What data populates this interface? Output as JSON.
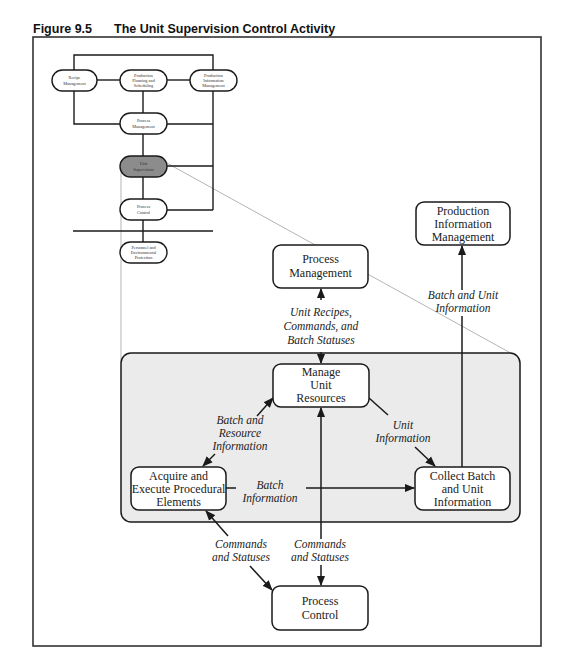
{
  "figure": {
    "number": "Figure 9.5",
    "title": "The Unit Supervision Control Activity"
  },
  "overview": {
    "nodes": [
      {
        "id": "recipe",
        "lines": [
          "Recipe",
          "Management"
        ],
        "highlighted": false
      },
      {
        "id": "planning",
        "lines": [
          "Production",
          "Planning and",
          "Scheduling"
        ],
        "highlighted": false
      },
      {
        "id": "prodinfo",
        "lines": [
          "Production",
          "Information",
          "Management"
        ],
        "highlighted": false
      },
      {
        "id": "procmgmt",
        "lines": [
          "Process",
          "Management"
        ],
        "highlighted": false
      },
      {
        "id": "unitsup",
        "lines": [
          "Unit",
          "Supervision"
        ],
        "highlighted": true
      },
      {
        "id": "proccontrol",
        "lines": [
          "Process",
          "Control"
        ],
        "highlighted": false
      },
      {
        "id": "personnel",
        "lines": [
          "Personnel and",
          "Environmental",
          "Protection"
        ],
        "highlighted": false
      }
    ]
  },
  "detail": {
    "nodes": [
      {
        "id": "process_management",
        "lines": [
          "Process",
          "Management"
        ]
      },
      {
        "id": "production_information_management",
        "lines": [
          "Production",
          "Information",
          "Management"
        ]
      },
      {
        "id": "manage_unit_resources",
        "lines": [
          "Manage",
          "Unit",
          "Resources"
        ]
      },
      {
        "id": "acquire_execute",
        "lines": [
          "Acquire and",
          "Execute Procedural",
          "Elements"
        ]
      },
      {
        "id": "collect_batch",
        "lines": [
          "Collect Batch",
          "and Unit",
          "Information"
        ]
      },
      {
        "id": "process_control",
        "lines": [
          "Process",
          "Control"
        ]
      }
    ],
    "flows": [
      {
        "id": "unit_recipes",
        "lines": [
          "Unit Recipes,",
          "Commands, and",
          "Batch Statuses"
        ]
      },
      {
        "id": "batch_unit_info",
        "lines": [
          "Batch and Unit",
          "Information"
        ]
      },
      {
        "id": "batch_resource_info",
        "lines": [
          "Batch and",
          "Resource",
          "Information"
        ]
      },
      {
        "id": "unit_info",
        "lines": [
          "Unit",
          "Information"
        ]
      },
      {
        "id": "batch_info",
        "lines": [
          "Batch",
          "Information"
        ]
      },
      {
        "id": "commands_statuses_left",
        "lines": [
          "Commands",
          "and Statuses"
        ]
      },
      {
        "id": "commands_statuses_mid",
        "lines": [
          "Commands",
          "and Statuses"
        ]
      }
    ]
  },
  "colors": {
    "highlight_fill": "#8c8c8c",
    "shaded_region": "#ebebeb",
    "connector_gray": "#b4b4b4",
    "line": "#1a1a1a"
  }
}
